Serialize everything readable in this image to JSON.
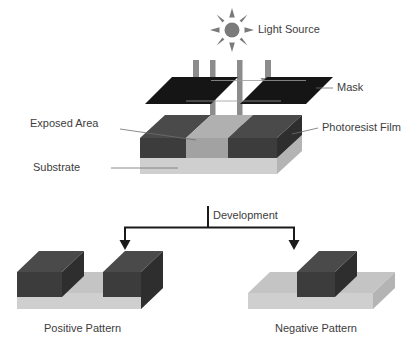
{
  "figure": {
    "title_text": "",
    "type": "photolithography-process-diagram"
  },
  "labels": {
    "light_source": "Light Source",
    "mask": "Mask",
    "exposed_area": "Exposed Area",
    "photoresist_film": "Photoresist Film",
    "substrate": "Substrate",
    "development": "Development",
    "positive_pattern": "Positive Pattern",
    "negative_pattern": "Negative Pattern"
  },
  "icons": {
    "sun": "sun-icon",
    "beam_arrow": "down-arrow-icon",
    "development_arrow": "down-arrow-icon"
  },
  "colors": {
    "mask_dark": "#151515",
    "resist_top": "#4a4a4a",
    "resist_front": "#3c3c3c",
    "resist_side": "#2e2e2e",
    "exposed_top": "#b0b0b0",
    "exposed_front": "#a2a2a2",
    "substrate_front": "#cfcfcf",
    "substrate_top": "#c4c4c4",
    "substrate_side": "#b4b4b4",
    "beam_gray": "#8c8c8c",
    "sun_gray": "#7a7a7a",
    "leader_line": "#6e6e6e",
    "arrow_black": "#1a1a1a",
    "text": "#3d3d3d",
    "background": "#ffffff"
  },
  "geometry": {
    "sun_center_x": 232,
    "sun_center_y": 30,
    "beam_x_positions": [
      196,
      213,
      240,
      268
    ],
    "mask_y": 88,
    "wafer_top_y": 128,
    "development_branch_y": 227
  },
  "structure": {
    "beams_blocked_count": 2,
    "beams_passing_count": 2,
    "mask_pieces": 2,
    "positive_blocks": 2,
    "negative_blocks": 1
  }
}
